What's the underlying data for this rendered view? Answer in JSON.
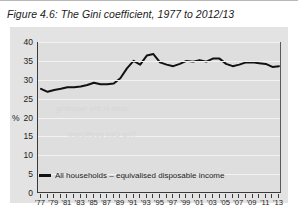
{
  "figure": {
    "title": "Figure 4.6: The Gini coefficient, 1977 to 2012/13"
  },
  "legend": {
    "swatch_name": "line-swatch",
    "label": "All households – equivalised disposable income"
  },
  "axis": {
    "y_unit_label": "%",
    "y_ticks": [
      "0",
      "5",
      "10",
      "15",
      "20",
      "25",
      "30",
      "35",
      "40"
    ],
    "x_ticks": [
      "'77",
      "'79",
      "'81",
      "'83",
      "'85",
      "'87",
      "'89",
      "'91",
      "'93",
      "'95",
      "'97",
      "'99",
      "'01",
      "'03",
      "'05",
      "'07",
      "'09",
      "'11",
      "'13"
    ]
  },
  "colors": {
    "line": "#111111",
    "panel": "#e3e3e3",
    "plot": "#dedede",
    "grid": "#f2f2f2",
    "axis": "#3a3a3a",
    "text": "#1b1b1b"
  },
  "chart_data": {
    "type": "line",
    "title": "Figure 4.6: The Gini coefficient, 1977 to 2012/13",
    "xlabel": "",
    "ylabel": "%",
    "ylim": [
      0,
      40
    ],
    "ytick_step": 5,
    "grid": true,
    "legend_position": "bottom-left",
    "x": [
      "'77",
      "'78",
      "'79",
      "'80",
      "'81",
      "'82",
      "'83",
      "'84",
      "'85",
      "'86",
      "'87",
      "'88",
      "'89",
      "'90",
      "'91",
      "'92",
      "'93",
      "'94",
      "'95",
      "'96",
      "'97",
      "'98",
      "'99",
      "'00",
      "'01",
      "'02",
      "'03",
      "'04",
      "'05",
      "'06",
      "'07",
      "'08",
      "'09",
      "'10",
      "'11",
      "'12",
      "'13"
    ],
    "series": [
      {
        "name": "All households – equivalised disposable income",
        "values": [
          27.6,
          26.8,
          27.3,
          27.6,
          28.0,
          28.0,
          28.2,
          28.6,
          29.2,
          28.8,
          28.8,
          29.0,
          30.4,
          33.0,
          35.0,
          34.0,
          36.4,
          36.8,
          34.6,
          34.0,
          33.6,
          34.2,
          35.0,
          34.8,
          35.2,
          34.8,
          35.6,
          35.6,
          34.2,
          33.6,
          34.0,
          34.6,
          34.6,
          34.4,
          34.2,
          33.4,
          33.6
        ]
      }
    ]
  }
}
